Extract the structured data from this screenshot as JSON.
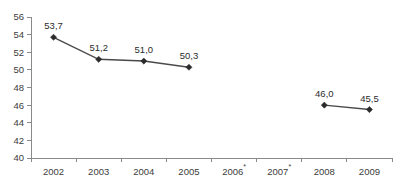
{
  "chart_data": {
    "type": "line",
    "title": "",
    "subtitle": "",
    "xlabel": "",
    "ylabel": "",
    "categories": [
      "2002",
      "2003",
      "2004",
      "2005",
      "2006*",
      "2007*",
      "2008",
      "2009"
    ],
    "category_labels": [
      {
        "text": "2002",
        "star": false
      },
      {
        "text": "2003",
        "star": false
      },
      {
        "text": "2004",
        "star": false
      },
      {
        "text": "2005",
        "star": false
      },
      {
        "text": "2006",
        "star": true
      },
      {
        "text": "2007",
        "star": true
      },
      {
        "text": "2008",
        "star": false
      },
      {
        "text": "2009",
        "star": false
      }
    ],
    "values": [
      53.7,
      51.2,
      51.0,
      50.3,
      null,
      null,
      46.0,
      45.5
    ],
    "data_labels": [
      "53,7",
      "51,2",
      "51,0",
      "50,3",
      "",
      "",
      "46,0",
      "45,5"
    ],
    "segments": [
      [
        0,
        1,
        2,
        3
      ],
      [
        6,
        7
      ]
    ],
    "ylim": [
      40,
      56
    ],
    "yticks": [
      40,
      42,
      44,
      46,
      48,
      50,
      52,
      54,
      56
    ],
    "ytick_labels": [
      "40",
      "42",
      "44",
      "46",
      "48",
      "50",
      "52",
      "54",
      "56"
    ],
    "grid": false,
    "legend": null,
    "decimal_separator": ",",
    "colors": {
      "line": "#4a4a4a",
      "marker": "#2b2b2b",
      "axis": "#8a8a8a",
      "text": "#3c3c3c",
      "background": "#ffffff"
    }
  }
}
